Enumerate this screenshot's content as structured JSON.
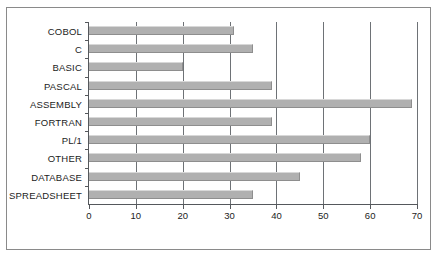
{
  "chart_data": {
    "type": "bar",
    "orientation": "horizontal",
    "title": "",
    "subtitle": "",
    "xlabel": "",
    "ylabel": "",
    "categories": [
      "COBOL",
      "C",
      "BASIC",
      "PASCAL",
      "ASSEMBLY",
      "FORTRAN",
      "PL/1",
      "OTHER",
      "DATABASE",
      "SPREADSHEET"
    ],
    "values": [
      31,
      35,
      20,
      39,
      69,
      39,
      60,
      58,
      45,
      35
    ],
    "xlim": [
      0,
      70
    ],
    "xticks": [
      0,
      10,
      20,
      30,
      40,
      50,
      60,
      70
    ],
    "xtick_labels": [
      "0",
      "10",
      "20",
      "30",
      "40",
      "50",
      "60",
      "70"
    ],
    "grid": "vertical",
    "legend": "none",
    "series": [
      {
        "name": "",
        "values": [
          31,
          35,
          20,
          39,
          69,
          39,
          60,
          58,
          45,
          35
        ]
      }
    ],
    "colors": {
      "bar_fill": "#b0b0b0",
      "bar_edge": "#8e8e8e",
      "axis": "#55585c",
      "grid": "#6e7276",
      "frame": "#8a8a8a",
      "background": "#ffffff",
      "text": "#1c1c1c"
    }
  }
}
